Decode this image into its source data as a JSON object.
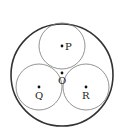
{
  "diagram": {
    "outer_circle": {
      "cx": 62,
      "cy": 75,
      "r": 51,
      "stroke": "#333333",
      "stroke_width": 1.6
    },
    "inner_circles": [
      {
        "id": "P",
        "cx": 62,
        "cy": 46,
        "r": 23
      },
      {
        "id": "Q",
        "cx": 39,
        "cy": 87,
        "r": 23
      },
      {
        "id": "R",
        "cx": 86,
        "cy": 87,
        "r": 23
      }
    ],
    "inner_stroke": "#777777",
    "points": [
      {
        "label": "P",
        "x": 62,
        "y": 46,
        "lx": 66,
        "ly": 50
      },
      {
        "label": "O",
        "x": 62,
        "y": 73,
        "lx": 58,
        "ly": 84
      },
      {
        "label": "Q",
        "x": 39,
        "y": 87,
        "lx": 35,
        "ly": 99
      },
      {
        "label": "R",
        "x": 86,
        "y": 87,
        "lx": 82,
        "ly": 99
      }
    ]
  }
}
